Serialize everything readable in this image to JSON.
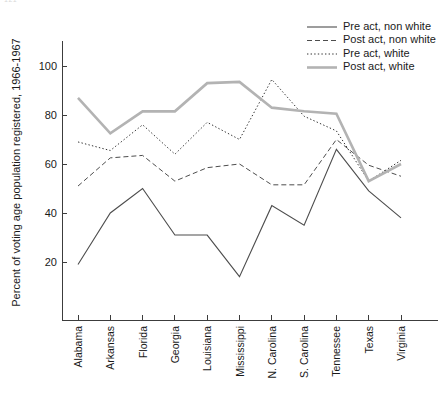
{
  "page_corner_note": "121",
  "chart_data": {
    "type": "line",
    "title": "",
    "xlabel": "",
    "ylabel": "Percent of voting age population registered, 1966-1967",
    "ylim": [
      0,
      110
    ],
    "yticks": [
      20,
      40,
      60,
      80,
      100
    ],
    "ytick_labels": [
      "20",
      "40",
      "60",
      "80",
      "100"
    ],
    "grid": false,
    "legend_position": "top-right",
    "categories": [
      "Alabama",
      "Arkansas",
      "Florida",
      "Georgia",
      "Louisiana",
      "Mississippi",
      "N. Carolina",
      "S. Carolina",
      "Tennessee",
      "Texas",
      "Virginia"
    ],
    "series": [
      {
        "name": "Pre act, non white",
        "style": "solid",
        "color": "#4d4d4d",
        "width": 1.1,
        "values": [
          19,
          40,
          50,
          31,
          31,
          14,
          43,
          35,
          66,
          49,
          38
        ]
      },
      {
        "name": "Post act, non white",
        "style": "dashed",
        "color": "#4d4d4d",
        "width": 1.0,
        "values": [
          51,
          62.5,
          63.5,
          53,
          58.5,
          60,
          51.5,
          51.5,
          70,
          59.5,
          55
        ]
      },
      {
        "name": "Pre act, white",
        "style": "dotted",
        "color": "#333333",
        "width": 1.0,
        "values": [
          69,
          65.5,
          76,
          64,
          77,
          70,
          94.5,
          79.5,
          73.5,
          53,
          61.5
        ]
      },
      {
        "name": "Post act, white",
        "style": "thick-solid",
        "color": "#b3b3b3",
        "width": 2.6,
        "values": [
          87,
          72.5,
          81.5,
          81.5,
          93,
          93.5,
          83,
          81.5,
          80.5,
          53,
          60
        ]
      }
    ]
  },
  "legend": {
    "entries": [
      "Pre act, non white",
      "Post act, non white",
      "Pre act, white",
      "Post act, white"
    ]
  }
}
